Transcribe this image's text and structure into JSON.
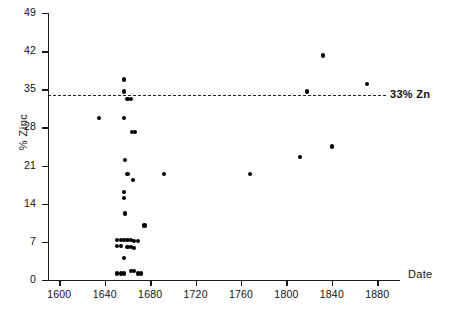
{
  "chart_data": {
    "type": "scatter",
    "title": "",
    "xlabel": "Date",
    "ylabel": "% Zinc",
    "xlim": [
      1590,
      1900
    ],
    "ylim": [
      0,
      49
    ],
    "grid": false,
    "legend": "none",
    "xticks": [
      1600,
      1640,
      1680,
      1720,
      1760,
      1800,
      1840,
      1880
    ],
    "yticks": [
      0,
      7,
      14,
      21,
      28,
      35,
      42,
      49
    ],
    "annotations": [
      {
        "name": "zinc-threshold",
        "type": "hline",
        "y": 33,
        "label": "33% Zn",
        "style": "dashed"
      }
    ],
    "series": [
      {
        "name": "Brass artefacts",
        "marker": "filled-circle",
        "color": "#000000",
        "points": [
          {
            "x": 1635,
            "y": 29.7
          },
          {
            "x": 1657,
            "y": 36.8
          },
          {
            "x": 1657,
            "y": 34.6
          },
          {
            "x": 1660,
            "y": 33.2
          },
          {
            "x": 1663,
            "y": 33.2
          },
          {
            "x": 1657,
            "y": 29.7
          },
          {
            "x": 1664,
            "y": 27.2
          },
          {
            "x": 1667,
            "y": 27.2
          },
          {
            "x": 1658,
            "y": 22.1
          },
          {
            "x": 1660,
            "y": 19.4
          },
          {
            "x": 1665,
            "y": 18.3
          },
          {
            "x": 1657,
            "y": 16.1
          },
          {
            "x": 1657,
            "y": 15.0
          },
          {
            "x": 1658,
            "y": 12.2
          },
          {
            "x": 1675,
            "y": 10.0
          },
          {
            "x": 1651,
            "y": 7.4
          },
          {
            "x": 1654,
            "y": 7.4
          },
          {
            "x": 1657,
            "y": 7.4
          },
          {
            "x": 1660,
            "y": 7.4
          },
          {
            "x": 1663,
            "y": 7.3
          },
          {
            "x": 1666,
            "y": 7.2
          },
          {
            "x": 1669,
            "y": 7.1
          },
          {
            "x": 1651,
            "y": 6.2
          },
          {
            "x": 1654,
            "y": 6.2
          },
          {
            "x": 1660,
            "y": 6.1
          },
          {
            "x": 1663,
            "y": 6.0
          },
          {
            "x": 1666,
            "y": 5.9
          },
          {
            "x": 1657,
            "y": 4.0
          },
          {
            "x": 1651,
            "y": 1.2
          },
          {
            "x": 1654,
            "y": 1.2
          },
          {
            "x": 1657,
            "y": 1.2
          },
          {
            "x": 1663,
            "y": 1.6
          },
          {
            "x": 1666,
            "y": 1.7
          },
          {
            "x": 1669,
            "y": 1.2
          },
          {
            "x": 1672,
            "y": 1.2
          },
          {
            "x": 1692,
            "y": 19.5
          },
          {
            "x": 1768,
            "y": 19.5
          },
          {
            "x": 1812,
            "y": 22.5
          },
          {
            "x": 1818,
            "y": 34.6
          },
          {
            "x": 1832,
            "y": 41.2
          },
          {
            "x": 1840,
            "y": 24.5
          },
          {
            "x": 1871,
            "y": 36.0
          }
        ]
      }
    ]
  }
}
